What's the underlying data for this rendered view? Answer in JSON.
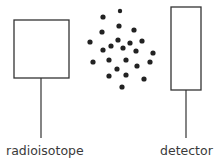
{
  "diagram": {
    "source": {
      "label": "radioisotope",
      "box": {
        "x": 14,
        "y": 20,
        "w": 55,
        "h": 58
      },
      "stem": {
        "x": 41,
        "y1": 78,
        "y2": 138
      }
    },
    "detector": {
      "label": "detector",
      "box": {
        "x": 171,
        "y": 7,
        "w": 30,
        "h": 83
      },
      "stem": {
        "x": 186,
        "y1": 90,
        "y2": 138
      }
    },
    "particles": [
      [
        120,
        11,
        2.2
      ],
      [
        103,
        17,
        2.6
      ],
      [
        119,
        26,
        2.6
      ],
      [
        134,
        30,
        2.6
      ],
      [
        102,
        32,
        2.6
      ],
      [
        90,
        42,
        2.6
      ],
      [
        118,
        40,
        2.6
      ],
      [
        130,
        43,
        2.6
      ],
      [
        142,
        41,
        2.6
      ],
      [
        111,
        46,
        2.6
      ],
      [
        123,
        48,
        2.6
      ],
      [
        103,
        50,
        2.6
      ],
      [
        136,
        51,
        2.6
      ],
      [
        153,
        53,
        2.6
      ],
      [
        109,
        60,
        2.6
      ],
      [
        126,
        60,
        2.6
      ],
      [
        93,
        62,
        2.6
      ],
      [
        150,
        62,
        2.6
      ],
      [
        137,
        66,
        2.6
      ],
      [
        117,
        69,
        2.6
      ],
      [
        109,
        76,
        2.6
      ],
      [
        126,
        75,
        2.6
      ],
      [
        144,
        79,
        2.6
      ],
      [
        122,
        87,
        2.6
      ]
    ],
    "colors": {
      "stroke": "#333333",
      "particle": "#222222"
    }
  }
}
